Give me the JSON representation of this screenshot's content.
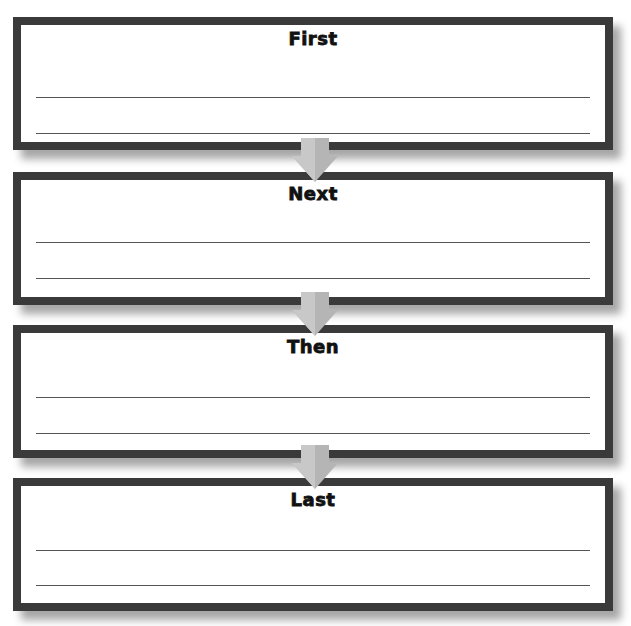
{
  "worksheet": {
    "steps": [
      {
        "label": "First"
      },
      {
        "label": "Next"
      },
      {
        "label": "Then"
      },
      {
        "label": "Last"
      }
    ],
    "lines_per_step": 2
  },
  "colors": {
    "border": "#3a3a3a",
    "arrow": "#b8b8b8",
    "line": "#555555"
  },
  "icons": {
    "connector": "down-arrow-icon"
  }
}
